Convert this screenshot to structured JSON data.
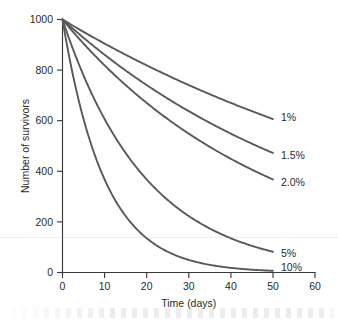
{
  "chart_data": {
    "type": "line",
    "title": "",
    "xlabel": "Time (days)",
    "ylabel": "Number of survivors",
    "xlim": [
      0,
      60
    ],
    "ylim": [
      0,
      1000
    ],
    "xticks": [
      0,
      10,
      20,
      30,
      40,
      50,
      60
    ],
    "yticks": [
      0,
      200,
      400,
      600,
      800,
      1000
    ],
    "xtick_labels": [
      "0",
      "10",
      "20",
      "30",
      "40",
      "50",
      "60"
    ],
    "ytick_labels": [
      "0",
      "200",
      "400",
      "600",
      "800",
      "1000"
    ],
    "grid": false,
    "legend_position": "inline-right-of-curve-ends",
    "line_color": "#595959",
    "x": [
      0,
      5,
      10,
      15,
      20,
      25,
      30,
      35,
      40,
      45,
      50
    ],
    "series": [
      {
        "name": "1%",
        "label": "1%",
        "rate_percent_per_day": 1.0,
        "values": [
          1000,
          951,
          905,
          861,
          819,
          779,
          741,
          705,
          670,
          638,
          607
        ],
        "end_value": 607
      },
      {
        "name": "1.5%",
        "label": "1.5%",
        "rate_percent_per_day": 1.5,
        "values": [
          1000,
          928,
          861,
          799,
          741,
          687,
          638,
          592,
          549,
          509,
          472
        ],
        "end_value": 472
      },
      {
        "name": "2.0%",
        "label": "2.0%",
        "rate_percent_per_day": 2.0,
        "values": [
          1000,
          905,
          819,
          741,
          670,
          607,
          549,
          497,
          449,
          407,
          368
        ],
        "end_value": 368
      },
      {
        "name": "5%",
        "label": "5%",
        "rate_percent_per_day": 5.0,
        "values": [
          1000,
          779,
          607,
          472,
          368,
          287,
          223,
          174,
          135,
          105,
          82
        ],
        "end_value": 82
      },
      {
        "name": "10%",
        "label": "10%",
        "rate_percent_per_day": 10.0,
        "values": [
          1000,
          607,
          368,
          223,
          135,
          82,
          50,
          30,
          18,
          11,
          7
        ],
        "end_value": 7
      }
    ]
  },
  "axes": {
    "y_axis_title": "Number of survivors",
    "x_axis_title": "Time (days)",
    "y_labels": {
      "v0": "0",
      "v200": "200",
      "v400": "400",
      "v600": "600",
      "v800": "800",
      "v1000": "1000"
    },
    "x_labels": {
      "v0": "0",
      "v10": "10",
      "v20": "20",
      "v30": "30",
      "v40": "40",
      "v50": "50",
      "v60": "60"
    }
  },
  "series_labels": {
    "s1": "1%",
    "s2": "1.5%",
    "s3": "2.0%",
    "s4": "5%",
    "s5": "10%"
  }
}
